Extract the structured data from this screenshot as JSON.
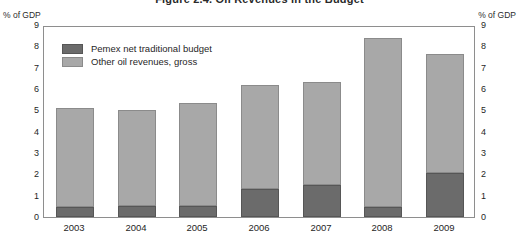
{
  "chart_data": {
    "type": "bar",
    "title": "Figure 2.4. Oil Revenues in the Budget",
    "subtitle": "",
    "xlabel": "",
    "ylabel": "% of GDP",
    "ylabel_right": "% of GDP",
    "ylim": [
      0,
      9
    ],
    "yticks": [
      0,
      1,
      2,
      3,
      4,
      5,
      6,
      7,
      8,
      9
    ],
    "ytick_labels": [
      "0",
      "1",
      "2",
      "3",
      "4",
      "5",
      "6",
      "7",
      "8",
      "9"
    ],
    "right_axis_ticks": [
      0,
      1,
      2,
      3,
      4,
      5,
      6,
      7,
      8,
      9
    ],
    "right_axis_tick_labels": [
      "0",
      "1",
      "2",
      "3",
      "4",
      "5",
      "6",
      "7",
      "8",
      "9"
    ],
    "categories": [
      "2003",
      "2004",
      "2005",
      "2006",
      "2007",
      "2008",
      "2009"
    ],
    "stacked": true,
    "grid": false,
    "legend_position": "upper-left-inside",
    "series": [
      {
        "name": "Pemex net traditional budget",
        "color": "#6b6b6b",
        "values": [
          0.45,
          0.5,
          0.5,
          1.3,
          1.5,
          0.45,
          2.05
        ]
      },
      {
        "name": "Other oil revenues, gross",
        "color": "#a8a8a8",
        "values": [
          4.65,
          4.5,
          4.85,
          4.9,
          4.85,
          7.95,
          5.6
        ]
      }
    ],
    "totals": [
      5.1,
      5.0,
      5.35,
      6.2,
      6.35,
      8.4,
      7.65
    ]
  },
  "axis": {
    "left_caption": "% of GDP",
    "right_caption": "% of GDP"
  }
}
